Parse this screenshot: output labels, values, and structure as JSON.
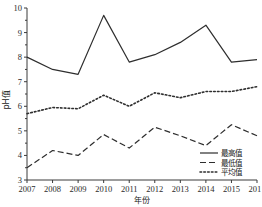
{
  "chart_data": {
    "type": "line",
    "title": "",
    "xlabel": "年份",
    "ylabel": "pH值",
    "x": [
      2007,
      2008,
      2009,
      2010,
      2011,
      2012,
      2013,
      2014,
      2015,
      2016
    ],
    "categories": [
      "2007",
      "2008",
      "2009",
      "2010",
      "2011",
      "2012",
      "2013",
      "2014",
      "2015",
      "2016"
    ],
    "xlim": [
      2007,
      2016
    ],
    "ylim": [
      3,
      10
    ],
    "yticks": [
      3,
      4,
      5,
      6,
      7,
      8,
      9,
      10
    ],
    "ytick_labels": [
      "3",
      "4",
      "5",
      "6",
      "7",
      "8",
      "9",
      "10"
    ],
    "xtick_labels": [
      "2007",
      "2008",
      "2009",
      "2010",
      "2011",
      "2012",
      "2013",
      "2014",
      "2015",
      "2016"
    ],
    "grid": false,
    "legend_position": "bottom-right",
    "series": [
      {
        "name": "最高值",
        "style": "solid",
        "color": "#2e2e2e",
        "values": [
          8.0,
          7.5,
          7.3,
          9.7,
          7.8,
          8.1,
          8.6,
          9.3,
          7.8,
          7.9
        ]
      },
      {
        "name": "最低值",
        "style": "dashed",
        "color": "#2e2e2e",
        "values": [
          3.5,
          4.2,
          4.0,
          4.85,
          4.3,
          5.15,
          4.8,
          4.4,
          5.25,
          4.8
        ]
      },
      {
        "name": "平均值",
        "style": "dotted",
        "color": "#2e2e2e",
        "values": [
          5.7,
          5.95,
          5.9,
          6.45,
          6.0,
          6.55,
          6.35,
          6.6,
          6.6,
          6.8
        ]
      }
    ]
  },
  "axis": {
    "y_title": "pH值",
    "x_title": "年份"
  },
  "legend": {
    "items": [
      {
        "label": "最高值",
        "style": "solid"
      },
      {
        "label": "最低值",
        "style": "dashed"
      },
      {
        "label": "平均值",
        "style": "dotted"
      }
    ]
  }
}
